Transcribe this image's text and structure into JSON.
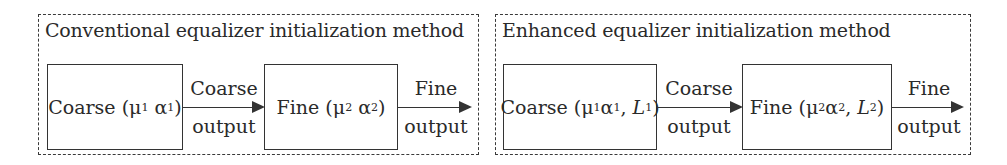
{
  "panels": [
    {
      "title": "Conventional equalizer initialization method",
      "coarse_block": {
        "name": "Coarse",
        "params": [
          {
            "sym": "μ",
            "sub": "1"
          },
          {
            "sym": "α",
            "sub": "1"
          }
        ]
      },
      "coarse_output_label": [
        "Coarse",
        "output"
      ],
      "fine_block": {
        "name": "Fine",
        "params": [
          {
            "sym": "μ",
            "sub": "2"
          },
          {
            "sym": "α",
            "sub": "2"
          }
        ]
      },
      "fine_output_label": [
        "Fine",
        "output"
      ]
    },
    {
      "title": "Enhanced equalizer initialization method",
      "coarse_block": {
        "name": "Coarse",
        "params": [
          {
            "sym": "μ",
            "sub": "1"
          },
          {
            "sym": "α",
            "sub": "1"
          },
          {
            "sym": "L",
            "sub": "1"
          }
        ]
      },
      "coarse_output_label": [
        "Coarse",
        "output"
      ],
      "fine_block": {
        "name": "Fine",
        "params": [
          {
            "sym": "μ",
            "sub": "2"
          },
          {
            "sym": "α",
            "sub": "2"
          },
          {
            "sym": "L",
            "sub": "2"
          }
        ]
      },
      "fine_output_label": [
        "Fine",
        "output"
      ]
    }
  ]
}
